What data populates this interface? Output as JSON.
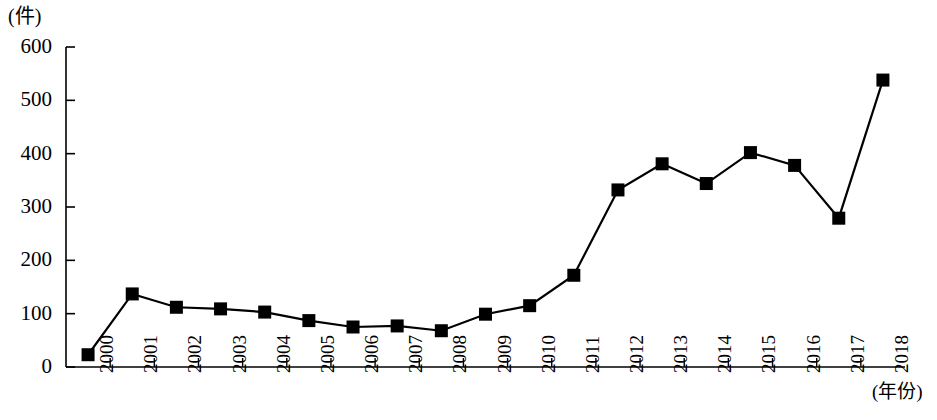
{
  "chart_data": {
    "type": "line",
    "title": "",
    "subtitle": "",
    "xlabel": "(年份)",
    "ylabel": "(件)",
    "unit_label": "(件)",
    "categories": [
      "2000",
      "2001",
      "2002",
      "2003",
      "2004",
      "2005",
      "2006",
      "2007",
      "2008",
      "2009",
      "2010",
      "2011",
      "2012",
      "2013",
      "2014",
      "2015",
      "2016",
      "2017",
      "2018"
    ],
    "values": [
      23,
      137,
      112,
      109,
      103,
      87,
      75,
      77,
      68,
      99,
      115,
      172,
      332,
      381,
      344,
      402,
      378,
      279,
      538
    ],
    "series": [
      {
        "name": "件数",
        "values": [
          23,
          137,
          112,
          109,
          103,
          87,
          75,
          77,
          68,
          99,
          115,
          172,
          332,
          381,
          344,
          402,
          378,
          279,
          538
        ]
      }
    ],
    "x": [
      "2000",
      "2001",
      "2002",
      "2003",
      "2004",
      "2005",
      "2006",
      "2007",
      "2008",
      "2009",
      "2010",
      "2011",
      "2012",
      "2013",
      "2014",
      "2015",
      "2016",
      "2017",
      "2018"
    ],
    "ylim": [
      0,
      600
    ],
    "ytick_labels": [
      "0",
      "100",
      "200",
      "300",
      "400",
      "500",
      "600"
    ],
    "ytick_values": [
      0,
      100,
      200,
      300,
      400,
      500,
      600
    ],
    "xtick_labels": [
      "2000",
      "2001",
      "2002",
      "2003",
      "2004",
      "2005",
      "2006",
      "2007",
      "2008",
      "2009",
      "2010",
      "2011",
      "2012",
      "2013",
      "2014",
      "2015",
      "2016",
      "2017",
      "2018"
    ],
    "grid": false,
    "legend": false,
    "legend_position": "none",
    "marker": "square",
    "line_color": "#000000",
    "marker_color": "#000000",
    "axis_color": "#000000",
    "background_color": "#ffffff",
    "annotations": []
  },
  "axis": {
    "y_unit": "(件)",
    "x_unit": "(年份)"
  }
}
